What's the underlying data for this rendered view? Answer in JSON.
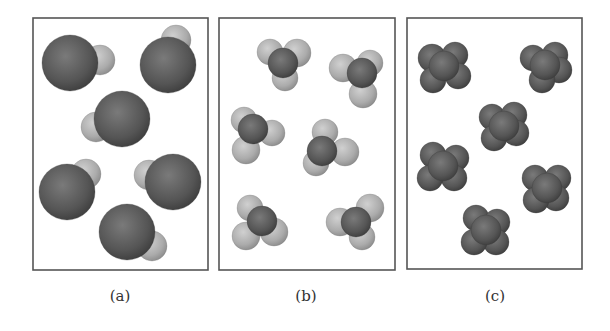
{
  "figure": {
    "panels": [
      {
        "id": "a",
        "label": "(a)",
        "description": "diatomic molecules: one large dark atom bonded to one small light atom",
        "box": {
          "x": 33,
          "y": 18,
          "w": 175,
          "h": 252
        },
        "label_pos": {
          "x": 120,
          "y": 287
        },
        "molecules": [
          {
            "atoms": [
              {
                "x": 100,
                "y": 60,
                "r": 15,
                "tone": "light"
              },
              {
                "x": 70,
                "y": 63,
                "r": 28,
                "tone": "dark"
              }
            ]
          },
          {
            "atoms": [
              {
                "x": 176,
                "y": 40,
                "r": 15,
                "tone": "light"
              },
              {
                "x": 168,
                "y": 65,
                "r": 28,
                "tone": "dark"
              }
            ]
          },
          {
            "atoms": [
              {
                "x": 96,
                "y": 127,
                "r": 15,
                "tone": "light"
              },
              {
                "x": 122,
                "y": 119,
                "r": 28,
                "tone": "dark"
              }
            ]
          },
          {
            "atoms": [
              {
                "x": 86,
                "y": 174,
                "r": 15,
                "tone": "light"
              },
              {
                "x": 67,
                "y": 192,
                "r": 28,
                "tone": "dark"
              }
            ]
          },
          {
            "atoms": [
              {
                "x": 149,
                "y": 175,
                "r": 15,
                "tone": "light"
              },
              {
                "x": 173,
                "y": 182,
                "r": 28,
                "tone": "dark"
              }
            ]
          },
          {
            "atoms": [
              {
                "x": 152,
                "y": 246,
                "r": 15,
                "tone": "light"
              },
              {
                "x": 127,
                "y": 232,
                "r": 28,
                "tone": "dark"
              }
            ]
          }
        ]
      },
      {
        "id": "b",
        "label": "(b)",
        "description": "molecules with one central dark atom surrounded by three light atoms",
        "box": {
          "x": 219,
          "y": 18,
          "w": 176,
          "h": 252
        },
        "label_pos": {
          "x": 306,
          "y": 287
        },
        "molecules": [
          {
            "atoms": [
              {
                "x": 270,
                "y": 52,
                "r": 13,
                "tone": "light"
              },
              {
                "x": 297,
                "y": 53,
                "r": 14,
                "tone": "light"
              },
              {
                "x": 285,
                "y": 78,
                "r": 13,
                "tone": "light"
              },
              {
                "x": 283,
                "y": 63,
                "r": 15,
                "tone": "dark"
              }
            ]
          },
          {
            "atoms": [
              {
                "x": 343,
                "y": 68,
                "r": 14,
                "tone": "light"
              },
              {
                "x": 370,
                "y": 63,
                "r": 13,
                "tone": "light"
              },
              {
                "x": 363,
                "y": 94,
                "r": 14,
                "tone": "light"
              },
              {
                "x": 362,
                "y": 73,
                "r": 15,
                "tone": "dark"
              }
            ]
          },
          {
            "atoms": [
              {
                "x": 244,
                "y": 120,
                "r": 13,
                "tone": "light"
              },
              {
                "x": 272,
                "y": 133,
                "r": 13,
                "tone": "light"
              },
              {
                "x": 246,
                "y": 150,
                "r": 14,
                "tone": "light"
              },
              {
                "x": 253,
                "y": 129,
                "r": 15,
                "tone": "dark"
              }
            ]
          },
          {
            "atoms": [
              {
                "x": 325,
                "y": 132,
                "r": 13,
                "tone": "light"
              },
              {
                "x": 345,
                "y": 152,
                "r": 14,
                "tone": "light"
              },
              {
                "x": 316,
                "y": 163,
                "r": 13,
                "tone": "light"
              },
              {
                "x": 322,
                "y": 151,
                "r": 15,
                "tone": "dark"
              }
            ]
          },
          {
            "atoms": [
              {
                "x": 250,
                "y": 208,
                "r": 13,
                "tone": "light"
              },
              {
                "x": 274,
                "y": 232,
                "r": 14,
                "tone": "light"
              },
              {
                "x": 246,
                "y": 236,
                "r": 14,
                "tone": "light"
              },
              {
                "x": 262,
                "y": 221,
                "r": 15,
                "tone": "dark"
              }
            ]
          },
          {
            "atoms": [
              {
                "x": 370,
                "y": 208,
                "r": 14,
                "tone": "light"
              },
              {
                "x": 340,
                "y": 222,
                "r": 14,
                "tone": "light"
              },
              {
                "x": 362,
                "y": 237,
                "r": 13,
                "tone": "light"
              },
              {
                "x": 356,
                "y": 222,
                "r": 15,
                "tone": "dark"
              }
            ]
          }
        ]
      },
      {
        "id": "c",
        "label": "(c)",
        "description": "compact clusters of dark atoms",
        "box": {
          "x": 407,
          "y": 18,
          "w": 175,
          "h": 251
        },
        "label_pos": {
          "x": 495,
          "y": 287
        },
        "molecules": [
          {
            "atoms": [
              {
                "x": 432,
                "y": 58,
                "r": 14,
                "tone": "dark"
              },
              {
                "x": 455,
                "y": 55,
                "r": 13,
                "tone": "dark"
              },
              {
                "x": 458,
                "y": 76,
                "r": 13,
                "tone": "dark"
              },
              {
                "x": 433,
                "y": 80,
                "r": 13,
                "tone": "dark"
              },
              {
                "x": 444,
                "y": 66,
                "r": 15,
                "tone": "dark"
              }
            ]
          },
          {
            "atoms": [
              {
                "x": 533,
                "y": 58,
                "r": 13,
                "tone": "dark"
              },
              {
                "x": 555,
                "y": 55,
                "r": 13,
                "tone": "dark"
              },
              {
                "x": 559,
                "y": 70,
                "r": 13,
                "tone": "dark"
              },
              {
                "x": 542,
                "y": 80,
                "r": 13,
                "tone": "dark"
              },
              {
                "x": 545,
                "y": 65,
                "r": 15,
                "tone": "dark"
              }
            ]
          },
          {
            "atoms": [
              {
                "x": 492,
                "y": 117,
                "r": 13,
                "tone": "dark"
              },
              {
                "x": 514,
                "y": 115,
                "r": 13,
                "tone": "dark"
              },
              {
                "x": 516,
                "y": 133,
                "r": 13,
                "tone": "dark"
              },
              {
                "x": 494,
                "y": 138,
                "r": 13,
                "tone": "dark"
              },
              {
                "x": 504,
                "y": 126,
                "r": 15,
                "tone": "dark"
              }
            ]
          },
          {
            "atoms": [
              {
                "x": 433,
                "y": 155,
                "r": 13,
                "tone": "dark"
              },
              {
                "x": 456,
                "y": 158,
                "r": 13,
                "tone": "dark"
              },
              {
                "x": 454,
                "y": 178,
                "r": 13,
                "tone": "dark"
              },
              {
                "x": 430,
                "y": 178,
                "r": 13,
                "tone": "dark"
              },
              {
                "x": 443,
                "y": 166,
                "r": 15,
                "tone": "dark"
              }
            ]
          },
          {
            "atoms": [
              {
                "x": 535,
                "y": 178,
                "r": 13,
                "tone": "dark"
              },
              {
                "x": 558,
                "y": 178,
                "r": 13,
                "tone": "dark"
              },
              {
                "x": 556,
                "y": 198,
                "r": 13,
                "tone": "dark"
              },
              {
                "x": 536,
                "y": 200,
                "r": 13,
                "tone": "dark"
              },
              {
                "x": 547,
                "y": 188,
                "r": 15,
                "tone": "dark"
              }
            ]
          },
          {
            "atoms": [
              {
                "x": 476,
                "y": 218,
                "r": 13,
                "tone": "dark"
              },
              {
                "x": 497,
                "y": 222,
                "r": 13,
                "tone": "dark"
              },
              {
                "x": 496,
                "y": 242,
                "r": 13,
                "tone": "dark"
              },
              {
                "x": 474,
                "y": 242,
                "r": 13,
                "tone": "dark"
              },
              {
                "x": 486,
                "y": 230,
                "r": 15,
                "tone": "dark"
              }
            ]
          }
        ]
      }
    ],
    "colors": {
      "background": "#ffffff",
      "box_border": "#555555",
      "dark_atom_center": "#7a7a7a",
      "dark_atom_edge": "#3e3e3e",
      "light_atom_center": "#d0d0d0",
      "light_atom_edge": "#8f8f8f",
      "label_text": "#333333"
    }
  }
}
